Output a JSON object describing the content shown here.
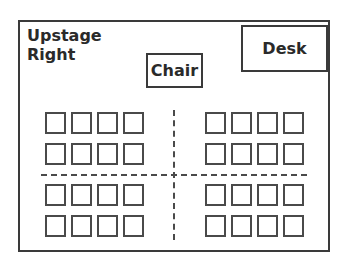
{
  "diagram": {
    "title_line1": "Upstage",
    "title_line2": "Right",
    "chair_label": "Chair",
    "desk_label": "Desk",
    "seating": {
      "groups": 4,
      "rows_per_group": 2,
      "seats_per_row": 4,
      "total_seats": 32
    },
    "colors": {
      "line": "#3a3a3a",
      "background": "#ffffff"
    }
  }
}
